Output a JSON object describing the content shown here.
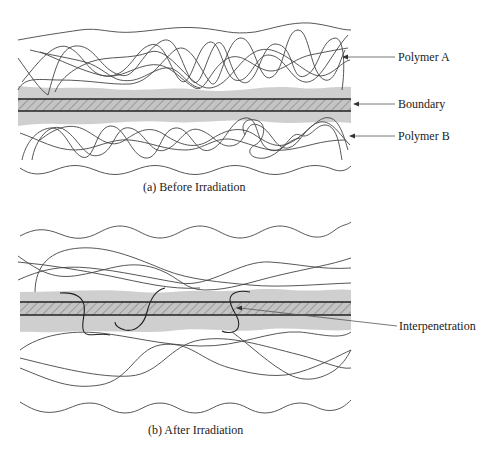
{
  "panels": {
    "a": {
      "caption": "(a) Before Irradiation",
      "labels": {
        "polymer_a": "Polymer A",
        "boundary": "Boundary",
        "polymer_b": "Polymer B"
      }
    },
    "b": {
      "caption": "(b) After Irradiation",
      "labels": {
        "interpenetration": "Interpenetration"
      }
    }
  },
  "colors": {
    "shaded_region": "#cfcfcf",
    "hatch": "#777777",
    "line": "#444444",
    "boundary_line": "#222222"
  }
}
